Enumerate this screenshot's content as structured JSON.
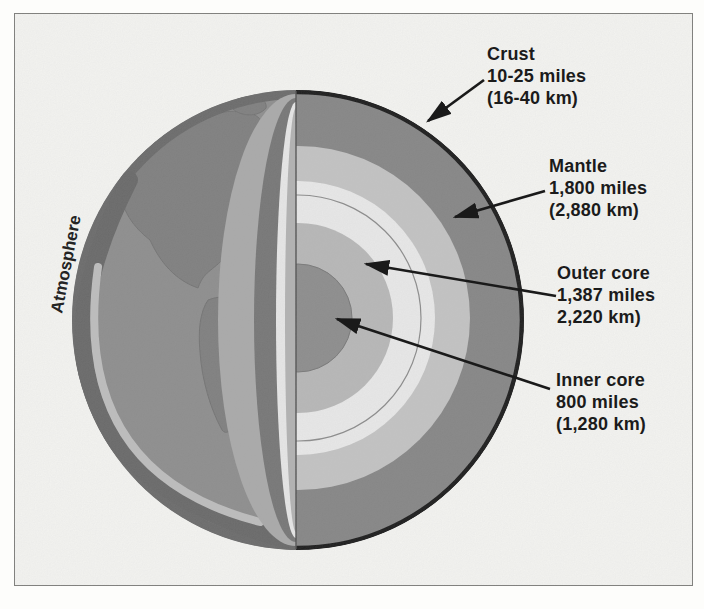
{
  "figure_title": "Cutaway diagram of Earth's interior layers",
  "atmosphere_label": "Atmosphere",
  "callouts": {
    "crust": {
      "title": "Crust",
      "miles": "10-25 miles",
      "km": "(16-40 km)"
    },
    "mantle": {
      "title": "Mantle",
      "miles": "1,800 miles",
      "km": "(2,880 km)"
    },
    "outer_core": {
      "title": "Outer core",
      "miles": "1,387 miles",
      "km": "2,220 km)"
    },
    "inner_core": {
      "title": "Inner core",
      "miles": "800 miles",
      "km": "(1,280 km)"
    }
  },
  "colors": {
    "surface": "#8c8c8c",
    "continent": "#7d7d7d",
    "limb_shadow": "#686868",
    "atmosphere_band": "#bdbdbd",
    "wedge_light": "#a9a9a9",
    "wedge_dark": "#747474",
    "wedge_white": "#e8e8e8",
    "wedge_gray": "#b2b2b2",
    "mantle": "#848484",
    "transition_ring": "#c3c3c3",
    "white_ring": "#eaeaea",
    "outer_core": "#b7b7b7",
    "inner_core": "#8b8b8b",
    "crust_outline": "#161616",
    "arrow": "#1a1a1a"
  }
}
